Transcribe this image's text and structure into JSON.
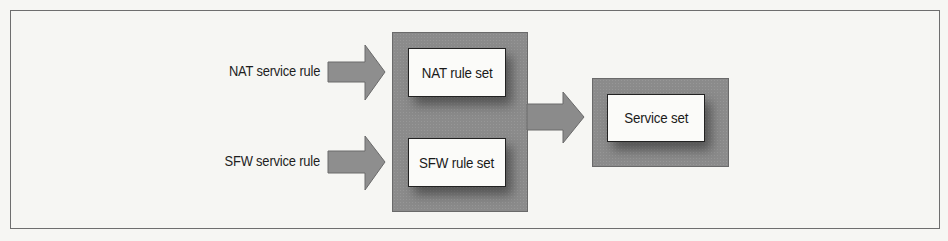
{
  "diagram": {
    "inputs": [
      {
        "label": "NAT service rule"
      },
      {
        "label": "SFW service rule"
      }
    ],
    "rule_sets": [
      {
        "label": "NAT rule set"
      },
      {
        "label": "SFW rule set"
      }
    ],
    "output": {
      "label": "Service set"
    },
    "colors": {
      "background": "#f6f6f3",
      "frame": "#6e6e6e",
      "group_fill": "#8b8b8b",
      "arrow_fill": "#8e8e8e",
      "box_fill": "#fbfbf9",
      "text": "#1e1e1e"
    }
  }
}
